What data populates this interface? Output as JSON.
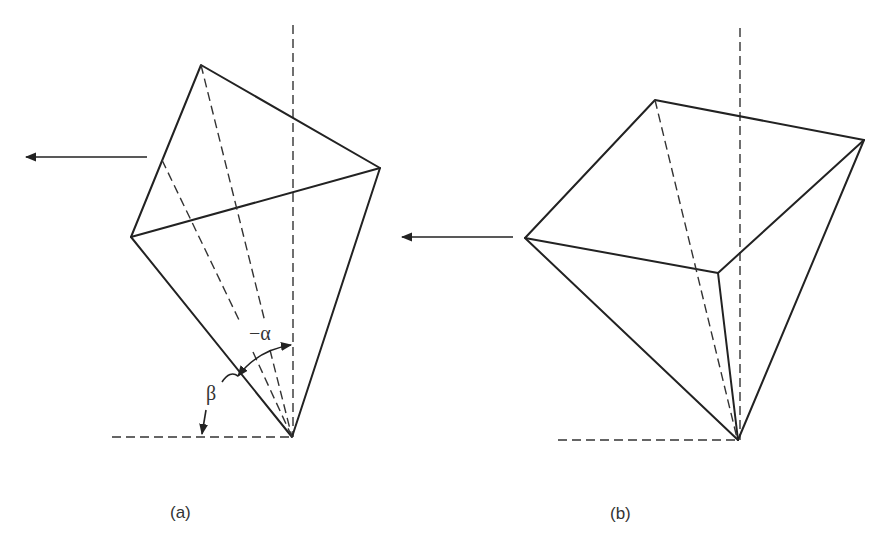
{
  "figure": {
    "panels": [
      {
        "id": "a",
        "caption": "(a)",
        "angle_labels": {
          "alpha": "−α",
          "beta": "β"
        },
        "arrow_direction": "left"
      },
      {
        "id": "b",
        "caption": "(b)",
        "arrow_direction": "left"
      }
    ]
  },
  "colors": {
    "line": "#222222",
    "background": "#ffffff"
  }
}
